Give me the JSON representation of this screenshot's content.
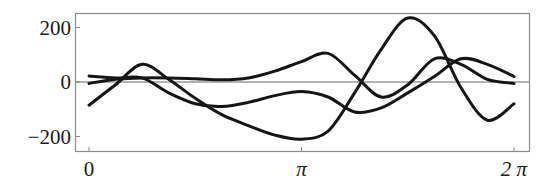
{
  "chart_data": {
    "type": "line",
    "title": "",
    "xlabel": "",
    "ylabel": "",
    "xlim": [
      0,
      6.2832
    ],
    "ylim": [
      -250,
      250
    ],
    "x_ticks": [
      {
        "value": 0,
        "label": "0"
      },
      {
        "value": 3.1416,
        "label": "π"
      },
      {
        "value": 6.2832,
        "label": "2 π"
      }
    ],
    "y_ticks": [
      {
        "value": 200,
        "label": "200"
      },
      {
        "value": 0,
        "label": "0"
      },
      {
        "value": -200,
        "label": "−200"
      }
    ],
    "grid": false,
    "reference_line_y": 0,
    "legend": null,
    "x": [
      0,
      0.3927,
      0.7854,
      1.1781,
      1.5708,
      1.9635,
      2.3562,
      2.7489,
      3.1416,
      3.5343,
      3.927,
      4.3197,
      4.7124,
      5.1051,
      5.4978,
      5.8905,
      6.2832
    ],
    "series": [
      {
        "name": "curve-1",
        "values": [
          -85,
          -10,
          65,
          10,
          -60,
          -120,
          -160,
          -195,
          -210,
          -180,
          -40,
          120,
          235,
          170,
          -20,
          -140,
          -80
        ]
      },
      {
        "name": "curve-2",
        "values": [
          22,
          15,
          15,
          -40,
          -80,
          -90,
          -75,
          -50,
          -35,
          -55,
          -110,
          -95,
          -40,
          20,
          85,
          65,
          20
        ]
      },
      {
        "name": "curve-3",
        "values": [
          -5,
          10,
          15,
          15,
          12,
          8,
          15,
          40,
          75,
          105,
          25,
          -55,
          -10,
          85,
          65,
          10,
          -5
        ]
      }
    ],
    "colors": {
      "curve": "#151515",
      "frame": "#8a8a8a",
      "zero_line": "#9a9a9a"
    }
  }
}
